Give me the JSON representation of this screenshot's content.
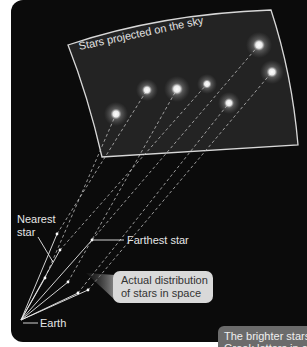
{
  "diagram": {
    "sky_panel_title": "Stars projected on the sky",
    "labels": {
      "nearest_star": [
        "Nearest",
        "star"
      ],
      "farthest_star": "Farthest star",
      "earth": "Earth"
    },
    "callout": [
      "Actual distribution",
      "of stars in space"
    ],
    "caption_partial": [
      "The brighter stars",
      "Greek letters in o"
    ],
    "colors": {
      "background": "#0b0b0b",
      "sky_panel": "#222222",
      "sky_border": "#d8d8d8",
      "star_glow": "#ffffff",
      "callout_bg": "#d9d9d9",
      "caption_bg": "#6b6b6b"
    },
    "stars_on_sky": [
      {
        "x": 116,
        "y": 114
      },
      {
        "x": 147,
        "y": 90
      },
      {
        "x": 177,
        "y": 89
      },
      {
        "x": 207,
        "y": 84
      },
      {
        "x": 229,
        "y": 103
      },
      {
        "x": 259,
        "y": 45
      },
      {
        "x": 272,
        "y": 72
      }
    ],
    "earth_position": {
      "x": 21,
      "y": 320
    }
  }
}
